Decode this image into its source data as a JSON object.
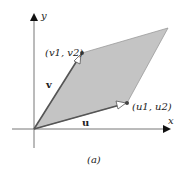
{
  "diagram": {
    "caption": "(a)",
    "axes": {
      "x_label": "x",
      "y_label": "y"
    },
    "vectors": [
      {
        "name": "u",
        "label": "u",
        "endpoint_label": "(u1, u2)"
      },
      {
        "name": "v",
        "label": "v",
        "endpoint_label": "(v1, v2)"
      }
    ],
    "shape": "parallelogram",
    "colors": {
      "fill": "#c4c4c4",
      "vector": "#555555",
      "axis": "#777777",
      "arrowhead": "#111111"
    }
  }
}
